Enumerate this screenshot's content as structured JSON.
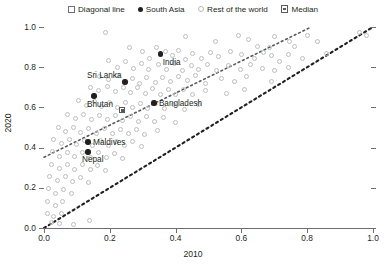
{
  "legend": {
    "items": [
      {
        "label": "Diagonal line",
        "marker": "square-open-icon"
      },
      {
        "label": "South Asia",
        "marker": "filled-dot-icon"
      },
      {
        "label": "Rest of the world",
        "marker": "circle-open-icon"
      },
      {
        "label": "Median",
        "marker": "median-square-icon"
      }
    ]
  },
  "chart_data": {
    "type": "scatter",
    "title": "",
    "xlabel": "2010",
    "ylabel": "2020",
    "xlim": [
      0.0,
      1.0
    ],
    "ylim": [
      0.0,
      1.0
    ],
    "xticks": [
      "0.0",
      "0.2",
      "0.4",
      "0.6",
      "0.8",
      "1.0"
    ],
    "yticks": [
      "0.0",
      "0.2",
      "0.4",
      "0.6",
      "0.8",
      "1.0"
    ],
    "xtick_values": [
      0.0,
      0.2,
      0.4,
      0.6,
      0.8,
      1.0
    ],
    "ytick_values": [
      0.0,
      0.2,
      0.4,
      0.6,
      0.8,
      1.0
    ],
    "grid": false,
    "legend_position": "top-center",
    "series": [
      {
        "name": "South Asia",
        "marker": "filled-dot",
        "color": "#231f20",
        "points": [
          {
            "label": "India",
            "x": 0.355,
            "y": 0.865,
            "label_dx": 2,
            "label_dy": 4
          },
          {
            "label": "Sri Lanka",
            "x": 0.246,
            "y": 0.726,
            "label_dx": -38,
            "label_dy": -11
          },
          {
            "label": "Bhutan",
            "x": 0.152,
            "y": 0.657,
            "label_dx": -7,
            "label_dy": 4
          },
          {
            "label": "Bangladesh",
            "x": 0.334,
            "y": 0.622,
            "label_dx": 5,
            "label_dy": -4
          },
          {
            "label": "Maldives",
            "x": 0.134,
            "y": 0.428,
            "label_dx": 5,
            "label_dy": -4
          },
          {
            "label": "Nepal",
            "x": 0.134,
            "y": 0.378,
            "label_dx": -6,
            "label_dy": 3
          }
        ]
      },
      {
        "name": "Median",
        "marker": "median-square",
        "color": "#58595b",
        "points": [
          {
            "label": "",
            "x": 0.237,
            "y": 0.587
          }
        ]
      },
      {
        "name": "Rest of the world",
        "marker": "circle-open",
        "color": "#bcbec0",
        "points": [
          {
            "x": 0.186,
            "y": 0.975
          },
          {
            "x": 0.43,
            "y": 0.955
          },
          {
            "x": 0.52,
            "y": 0.93
          },
          {
            "x": 0.592,
            "y": 0.96
          },
          {
            "x": 0.622,
            "y": 0.94
          },
          {
            "x": 0.65,
            "y": 0.905
          },
          {
            "x": 0.7,
            "y": 0.955
          },
          {
            "x": 0.684,
            "y": 0.9
          },
          {
            "x": 0.746,
            "y": 0.93
          },
          {
            "x": 0.76,
            "y": 0.902
          },
          {
            "x": 0.8,
            "y": 0.96
          },
          {
            "x": 0.83,
            "y": 0.93
          },
          {
            "x": 0.96,
            "y": 0.975
          },
          {
            "x": 0.98,
            "y": 0.96
          },
          {
            "x": 0.26,
            "y": 0.9
          },
          {
            "x": 0.3,
            "y": 0.88
          },
          {
            "x": 0.32,
            "y": 0.845
          },
          {
            "x": 0.342,
            "y": 0.9
          },
          {
            "x": 0.37,
            "y": 0.88
          },
          {
            "x": 0.39,
            "y": 0.86
          },
          {
            "x": 0.408,
            "y": 0.885
          },
          {
            "x": 0.43,
            "y": 0.84
          },
          {
            "x": 0.452,
            "y": 0.87
          },
          {
            "x": 0.48,
            "y": 0.845
          },
          {
            "x": 0.505,
            "y": 0.872
          },
          {
            "x": 0.53,
            "y": 0.855
          },
          {
            "x": 0.568,
            "y": 0.88
          },
          {
            "x": 0.6,
            "y": 0.862
          },
          {
            "x": 0.64,
            "y": 0.845
          },
          {
            "x": 0.666,
            "y": 0.875
          },
          {
            "x": 0.69,
            "y": 0.858
          },
          {
            "x": 0.716,
            "y": 0.83
          },
          {
            "x": 0.742,
            "y": 0.862
          },
          {
            "x": 0.786,
            "y": 0.845
          },
          {
            "x": 0.86,
            "y": 0.87
          },
          {
            "x": 0.195,
            "y": 0.835
          },
          {
            "x": 0.222,
            "y": 0.8
          },
          {
            "x": 0.248,
            "y": 0.83
          },
          {
            "x": 0.272,
            "y": 0.795
          },
          {
            "x": 0.296,
            "y": 0.818
          },
          {
            "x": 0.318,
            "y": 0.788
          },
          {
            "x": 0.348,
            "y": 0.812
          },
          {
            "x": 0.372,
            "y": 0.79
          },
          {
            "x": 0.398,
            "y": 0.818
          },
          {
            "x": 0.42,
            "y": 0.782
          },
          {
            "x": 0.448,
            "y": 0.808
          },
          {
            "x": 0.47,
            "y": 0.79
          },
          {
            "x": 0.496,
            "y": 0.812
          },
          {
            "x": 0.524,
            "y": 0.785
          },
          {
            "x": 0.56,
            "y": 0.806
          },
          {
            "x": 0.596,
            "y": 0.79
          },
          {
            "x": 0.628,
            "y": 0.812
          },
          {
            "x": 0.664,
            "y": 0.795
          },
          {
            "x": 0.7,
            "y": 0.782
          },
          {
            "x": 0.742,
            "y": 0.8
          },
          {
            "x": 0.168,
            "y": 0.752
          },
          {
            "x": 0.196,
            "y": 0.74
          },
          {
            "x": 0.222,
            "y": 0.76
          },
          {
            "x": 0.268,
            "y": 0.742
          },
          {
            "x": 0.29,
            "y": 0.718
          },
          {
            "x": 0.312,
            "y": 0.748
          },
          {
            "x": 0.338,
            "y": 0.722
          },
          {
            "x": 0.36,
            "y": 0.75
          },
          {
            "x": 0.386,
            "y": 0.728
          },
          {
            "x": 0.41,
            "y": 0.756
          },
          {
            "x": 0.436,
            "y": 0.732
          },
          {
            "x": 0.462,
            "y": 0.758
          },
          {
            "x": 0.49,
            "y": 0.72
          },
          {
            "x": 0.54,
            "y": 0.745
          },
          {
            "x": 0.578,
            "y": 0.73
          },
          {
            "x": 0.614,
            "y": 0.752
          },
          {
            "x": 0.692,
            "y": 0.73
          },
          {
            "x": 0.14,
            "y": 0.7
          },
          {
            "x": 0.166,
            "y": 0.682
          },
          {
            "x": 0.194,
            "y": 0.705
          },
          {
            "x": 0.216,
            "y": 0.678
          },
          {
            "x": 0.242,
            "y": 0.7
          },
          {
            "x": 0.262,
            "y": 0.672
          },
          {
            "x": 0.284,
            "y": 0.698
          },
          {
            "x": 0.308,
            "y": 0.67
          },
          {
            "x": 0.33,
            "y": 0.694
          },
          {
            "x": 0.354,
            "y": 0.666
          },
          {
            "x": 0.378,
            "y": 0.69
          },
          {
            "x": 0.4,
            "y": 0.664
          },
          {
            "x": 0.424,
            "y": 0.688
          },
          {
            "x": 0.452,
            "y": 0.662
          },
          {
            "x": 0.492,
            "y": 0.686
          },
          {
            "x": 0.556,
            "y": 0.668
          },
          {
            "x": 0.608,
            "y": 0.69
          },
          {
            "x": 0.104,
            "y": 0.632
          },
          {
            "x": 0.128,
            "y": 0.61
          },
          {
            "x": 0.152,
            "y": 0.628
          },
          {
            "x": 0.176,
            "y": 0.602
          },
          {
            "x": 0.2,
            "y": 0.626
          },
          {
            "x": 0.224,
            "y": 0.6
          },
          {
            "x": 0.248,
            "y": 0.624
          },
          {
            "x": 0.27,
            "y": 0.598
          },
          {
            "x": 0.292,
            "y": 0.62
          },
          {
            "x": 0.316,
            "y": 0.596
          },
          {
            "x": 0.34,
            "y": 0.618
          },
          {
            "x": 0.366,
            "y": 0.594
          },
          {
            "x": 0.394,
            "y": 0.614
          },
          {
            "x": 0.426,
            "y": 0.59
          },
          {
            "x": 0.47,
            "y": 0.612
          },
          {
            "x": 0.072,
            "y": 0.566
          },
          {
            "x": 0.096,
            "y": 0.544
          },
          {
            "x": 0.12,
            "y": 0.566
          },
          {
            "x": 0.144,
            "y": 0.54
          },
          {
            "x": 0.168,
            "y": 0.562
          },
          {
            "x": 0.192,
            "y": 0.538
          },
          {
            "x": 0.216,
            "y": 0.56
          },
          {
            "x": 0.24,
            "y": 0.534
          },
          {
            "x": 0.264,
            "y": 0.556
          },
          {
            "x": 0.288,
            "y": 0.53
          },
          {
            "x": 0.312,
            "y": 0.554
          },
          {
            "x": 0.336,
            "y": 0.528
          },
          {
            "x": 0.362,
            "y": 0.55
          },
          {
            "x": 0.4,
            "y": 0.526
          },
          {
            "x": 0.044,
            "y": 0.5
          },
          {
            "x": 0.066,
            "y": 0.478
          },
          {
            "x": 0.09,
            "y": 0.498
          },
          {
            "x": 0.112,
            "y": 0.474
          },
          {
            "x": 0.136,
            "y": 0.496
          },
          {
            "x": 0.16,
            "y": 0.472
          },
          {
            "x": 0.184,
            "y": 0.494
          },
          {
            "x": 0.208,
            "y": 0.47
          },
          {
            "x": 0.232,
            "y": 0.492
          },
          {
            "x": 0.256,
            "y": 0.468
          },
          {
            "x": 0.28,
            "y": 0.49
          },
          {
            "x": 0.306,
            "y": 0.466
          },
          {
            "x": 0.344,
            "y": 0.486
          },
          {
            "x": 0.03,
            "y": 0.44
          },
          {
            "x": 0.054,
            "y": 0.418
          },
          {
            "x": 0.078,
            "y": 0.438
          },
          {
            "x": 0.1,
            "y": 0.414
          },
          {
            "x": 0.124,
            "y": 0.436
          },
          {
            "x": 0.148,
            "y": 0.412
          },
          {
            "x": 0.172,
            "y": 0.434
          },
          {
            "x": 0.196,
            "y": 0.41
          },
          {
            "x": 0.22,
            "y": 0.432
          },
          {
            "x": 0.244,
            "y": 0.408
          },
          {
            "x": 0.268,
            "y": 0.43
          },
          {
            "x": 0.296,
            "y": 0.406
          },
          {
            "x": 0.026,
            "y": 0.38
          },
          {
            "x": 0.048,
            "y": 0.358
          },
          {
            "x": 0.072,
            "y": 0.378
          },
          {
            "x": 0.094,
            "y": 0.354
          },
          {
            "x": 0.118,
            "y": 0.376
          },
          {
            "x": 0.142,
            "y": 0.352
          },
          {
            "x": 0.166,
            "y": 0.374
          },
          {
            "x": 0.19,
            "y": 0.35
          },
          {
            "x": 0.214,
            "y": 0.372
          },
          {
            "x": 0.24,
            "y": 0.348
          },
          {
            "x": 0.022,
            "y": 0.318
          },
          {
            "x": 0.046,
            "y": 0.296
          },
          {
            "x": 0.07,
            "y": 0.316
          },
          {
            "x": 0.092,
            "y": 0.292
          },
          {
            "x": 0.116,
            "y": 0.314
          },
          {
            "x": 0.14,
            "y": 0.29
          },
          {
            "x": 0.164,
            "y": 0.312
          },
          {
            "x": 0.188,
            "y": 0.288
          },
          {
            "x": 0.018,
            "y": 0.256
          },
          {
            "x": 0.042,
            "y": 0.234
          },
          {
            "x": 0.064,
            "y": 0.254
          },
          {
            "x": 0.088,
            "y": 0.23
          },
          {
            "x": 0.112,
            "y": 0.25
          },
          {
            "x": 0.136,
            "y": 0.226
          },
          {
            "x": 0.014,
            "y": 0.196
          },
          {
            "x": 0.036,
            "y": 0.174
          },
          {
            "x": 0.06,
            "y": 0.192
          },
          {
            "x": 0.084,
            "y": 0.17
          },
          {
            "x": 0.012,
            "y": 0.132
          },
          {
            "x": 0.034,
            "y": 0.112
          },
          {
            "x": 0.056,
            "y": 0.13
          },
          {
            "x": 0.01,
            "y": 0.072
          },
          {
            "x": 0.03,
            "y": 0.056
          },
          {
            "x": 0.052,
            "y": 0.07
          },
          {
            "x": 0.022,
            "y": 0.026
          },
          {
            "x": 0.046,
            "y": 0.02
          },
          {
            "x": 0.09,
            "y": 0.016
          },
          {
            "x": 0.138,
            "y": 0.036
          }
        ]
      }
    ],
    "reference_lines": [
      {
        "name": "diagonal-line",
        "style": "dotted",
        "color": "#231f20",
        "from": {
          "x": 0.0,
          "y": 0.0
        },
        "to": {
          "x": 1.0,
          "y": 1.0
        }
      },
      {
        "name": "median-line",
        "style": "dotted",
        "color": "#58595b",
        "from": {
          "x": 0.0,
          "y": 0.352
        },
        "to": {
          "x": 0.812,
          "y": 1.0
        }
      }
    ]
  }
}
